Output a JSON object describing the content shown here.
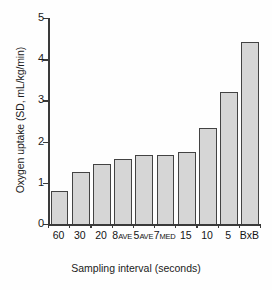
{
  "chart_data": {
    "type": "bar",
    "title": "",
    "xlabel": "Sampling interval (seconds)",
    "ylabel": "Oxygen uptake (SD, mL/kg/min)",
    "categories": [
      "60",
      "30",
      "20",
      "8AVE",
      "5AVE",
      "7MED",
      "15",
      "10",
      "5",
      "BxB"
    ],
    "category_parts": [
      {
        "main": "60",
        "sub": ""
      },
      {
        "main": "30",
        "sub": ""
      },
      {
        "main": "20",
        "sub": ""
      },
      {
        "main": "8",
        "sub": "AVE"
      },
      {
        "main": "5",
        "sub": "AVE"
      },
      {
        "main": "7",
        "sub": "MED"
      },
      {
        "main": "15",
        "sub": ""
      },
      {
        "main": "10",
        "sub": ""
      },
      {
        "main": "5",
        "sub": ""
      },
      {
        "main": "BxB",
        "sub": ""
      }
    ],
    "values": [
      0.8,
      1.27,
      1.46,
      1.57,
      1.68,
      1.68,
      1.76,
      2.34,
      3.21,
      4.41
    ],
    "ylim": [
      0,
      5
    ],
    "yticks": [
      0,
      1,
      2,
      3,
      4,
      5
    ],
    "ytick_labels": [
      "0",
      "1",
      "2",
      "3",
      "4",
      "5"
    ],
    "grid": false,
    "legend": "none",
    "bar_fill_color": "#d6d6d6",
    "bar_edge_color": "#434343",
    "axis_color": "#3a3a3a"
  }
}
